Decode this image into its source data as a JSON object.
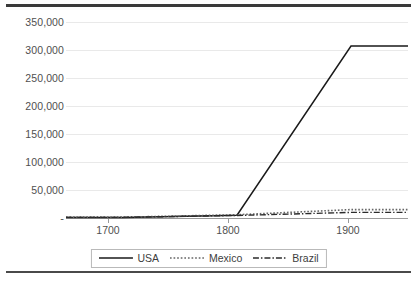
{
  "chart_data": {
    "type": "line",
    "title": "",
    "xlabel": "",
    "ylabel": "",
    "x": [
      1700,
      1800,
      1900
    ],
    "xlim": [
      1650,
      1950
    ],
    "ylim": [
      0,
      350000
    ],
    "grid": true,
    "legend_position": "bottom",
    "x_tick_labels": [
      "1700",
      "1800",
      "1900"
    ],
    "y_tick_labels": [
      "350,000",
      "300,000",
      "250,000",
      "200,000",
      "150,000",
      "100,000",
      "50,000",
      "-"
    ],
    "y_tick_values": [
      350000,
      300000,
      250000,
      200000,
      150000,
      100000,
      50000,
      0
    ],
    "series": [
      {
        "name": "USA",
        "line_style": "solid",
        "color": "#1a1a1a",
        "values": [
          1000,
          5000,
          307000
        ]
      },
      {
        "name": "Mexico",
        "line_style": "dotted",
        "color": "#555555",
        "values": [
          1500,
          5800,
          15000
        ]
      },
      {
        "name": "Brazil",
        "line_style": "dash-dot",
        "color": "#2b2b2b",
        "values": [
          1200,
          4500,
          10000
        ]
      }
    ]
  },
  "legend": {
    "items": [
      {
        "label": "USA",
        "style": "solid"
      },
      {
        "label": "Mexico",
        "style": "dotted"
      },
      {
        "label": "Brazil",
        "style": "dash-dot"
      }
    ]
  },
  "axis": {
    "y_labels": [
      "350,000",
      "300,000",
      "250,000",
      "200,000",
      "150,000",
      "100,000",
      "50,000",
      "-"
    ],
    "x_labels": [
      "1700",
      "1800",
      "1900"
    ]
  }
}
